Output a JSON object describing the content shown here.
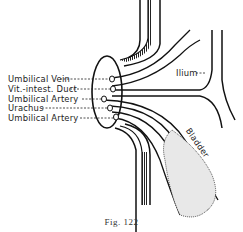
{
  "figure": {
    "caption": "Fig. 122",
    "labels_left": [
      {
        "text": "Umbilical Vein",
        "y": 75
      },
      {
        "text": "Vit.-intest. Duct",
        "y": 85
      },
      {
        "text": "Umbilical Artery",
        "y": 95
      },
      {
        "text": "Urachus",
        "y": 105
      },
      {
        "text": "Umbilical Artery",
        "y": 115
      }
    ],
    "labels_right": [
      {
        "text": "Ilium",
        "y": 66
      },
      {
        "text": "Bladder",
        "y": 118
      }
    ]
  }
}
